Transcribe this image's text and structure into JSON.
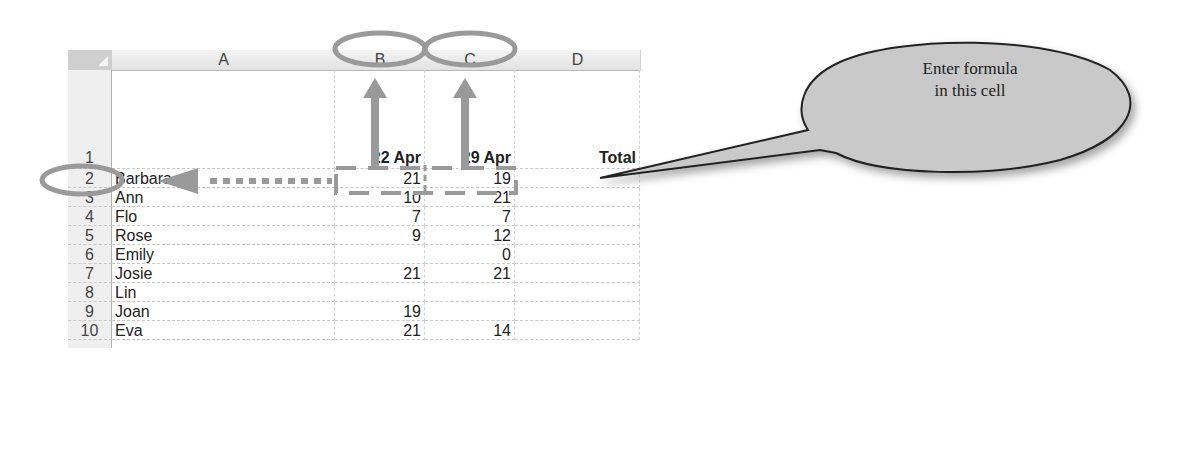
{
  "spreadsheet": {
    "columns": [
      {
        "id": "A",
        "label": "A"
      },
      {
        "id": "B",
        "label": "B"
      },
      {
        "id": "C",
        "label": "C"
      },
      {
        "id": "D",
        "label": "D"
      }
    ],
    "rows": [
      {
        "num": "1",
        "A": "",
        "B": "22 Apr",
        "C": "29 Apr",
        "D": "Total"
      },
      {
        "num": "2",
        "A": "Barbara",
        "B": "21",
        "C": "19",
        "D": ""
      },
      {
        "num": "3",
        "A": "Ann",
        "B": "10",
        "C": "21",
        "D": ""
      },
      {
        "num": "4",
        "A": "Flo",
        "B": "7",
        "C": "7",
        "D": ""
      },
      {
        "num": "5",
        "A": "Rose",
        "B": "9",
        "C": "12",
        "D": ""
      },
      {
        "num": "6",
        "A": "Emily",
        "B": "",
        "C": "0",
        "D": ""
      },
      {
        "num": "7",
        "A": "Josie",
        "B": "21",
        "C": "21",
        "D": ""
      },
      {
        "num": "8",
        "A": "Lin",
        "B": "",
        "C": "",
        "D": ""
      },
      {
        "num": "9",
        "A": "Joan",
        "B": "19",
        "C": "",
        "D": ""
      },
      {
        "num": "10",
        "A": "Eva",
        "B": "21",
        "C": "14",
        "D": ""
      }
    ]
  },
  "annotations": {
    "callout": {
      "line1": "Enter formula",
      "line2": "in this cell"
    },
    "highlight_color": "#9a9a9a",
    "circled_columns": [
      "B",
      "C"
    ],
    "circled_row": "2",
    "selected_cells": [
      "B2",
      "C2"
    ],
    "target_cell": "D2"
  }
}
